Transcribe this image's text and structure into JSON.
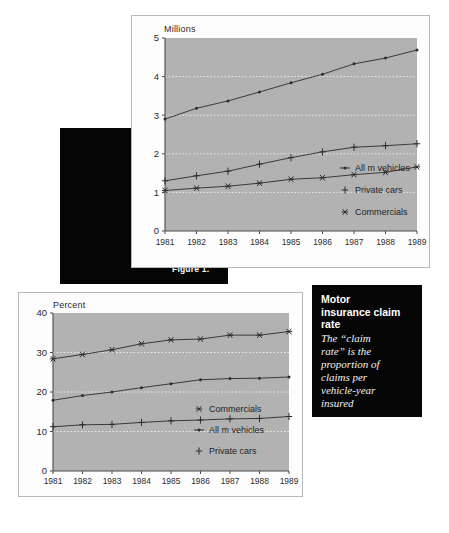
{
  "page": {
    "background": "#ffffff",
    "plot_fill": "#b2b2b2",
    "panel_fill": "#fdfdfd",
    "ink": "#2a2a2a",
    "callout_fill": "#050505",
    "callout_text": "#ffffff"
  },
  "callouts": {
    "left": {
      "name": "motor-insurance-claims",
      "title_lines": [
        "Motor",
        "insurance",
        "claims"
      ],
      "title": "Motor insurance claims"
    },
    "right": {
      "name": "motor-insurance-claim-rate",
      "title_lines": [
        "Motor",
        "insurance claim",
        "rate"
      ],
      "title": "Motor insurance claim rate",
      "body_lines": [
        "The “claim",
        "rate” is the",
        "proportion of",
        "claims per",
        "vehicle-year",
        "insured"
      ],
      "body": "The “claim rate” is the proportion of claims per vehicle-year insured"
    }
  },
  "figure_caption": "Figure 1.",
  "chart_data": [
    {
      "id": "claims-chart",
      "type": "line",
      "title": "",
      "ylabel": "Millions",
      "xlabel": "",
      "ylim": [
        0,
        5
      ],
      "yticks": [
        0,
        1,
        2,
        3,
        4,
        5
      ],
      "ytick_labels": [
        "0",
        "1",
        "2",
        "3",
        "4",
        "5"
      ],
      "grid": true,
      "grid_style": "dotted",
      "legend_position": "inside-bottom-right",
      "categories": [
        "1981",
        "1982",
        "1983",
        "1984",
        "1985",
        "1986",
        "1987",
        "1988",
        "1989"
      ],
      "x": [
        1981,
        1982,
        1983,
        1984,
        1985,
        1986,
        1987,
        1988,
        1989
      ],
      "series": [
        {
          "name": "All m vehicles",
          "marker": "dot",
          "values": [
            2.9,
            3.18,
            3.37,
            3.6,
            3.84,
            4.06,
            4.33,
            4.48,
            4.69
          ]
        },
        {
          "name": "Private cars",
          "marker": "plus",
          "values": [
            1.3,
            1.43,
            1.55,
            1.73,
            1.9,
            2.05,
            2.17,
            2.21,
            2.26
          ]
        },
        {
          "name": "Commercials",
          "marker": "star",
          "values": [
            1.05,
            1.11,
            1.16,
            1.24,
            1.34,
            1.38,
            1.46,
            1.52,
            1.66
          ]
        }
      ]
    },
    {
      "id": "claim-rate-chart",
      "type": "line",
      "title": "",
      "ylabel": "Percent",
      "xlabel": "",
      "ylim": [
        0,
        40
      ],
      "yticks": [
        0,
        10,
        20,
        30,
        40
      ],
      "ytick_labels": [
        "0",
        "10",
        "20",
        "30",
        "40"
      ],
      "grid": true,
      "grid_style": "dotted",
      "legend_position": "inside-bottom-right",
      "categories": [
        "1981",
        "1982",
        "1983",
        "1984",
        "1985",
        "1986",
        "1987",
        "1988",
        "1989"
      ],
      "x": [
        1981,
        1982,
        1983,
        1984,
        1985,
        1986,
        1987,
        1988,
        1989
      ],
      "series": [
        {
          "name": "Commercials",
          "marker": "star",
          "values": [
            28.4,
            29.5,
            30.7,
            32.2,
            33.2,
            33.4,
            34.4,
            34.4,
            35.3
          ]
        },
        {
          "name": "All m vehicles",
          "marker": "dot",
          "values": [
            17.9,
            19.1,
            20.0,
            21.1,
            22.1,
            23.1,
            23.4,
            23.5,
            23.8
          ]
        },
        {
          "name": "Private cars",
          "marker": "plus",
          "values": [
            11.2,
            11.7,
            11.8,
            12.3,
            12.7,
            12.9,
            13.2,
            13.3,
            13.8
          ]
        }
      ]
    }
  ]
}
